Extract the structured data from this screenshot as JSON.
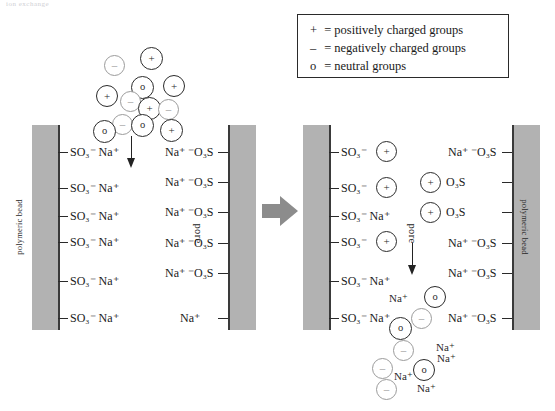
{
  "figure": {
    "cropped_header_text": "ion exchange",
    "background_color": "#ffffff"
  },
  "legend": {
    "name": "legend-box",
    "rows": [
      {
        "symbol": "+",
        "text": "= positively charged groups"
      },
      {
        "symbol": "–",
        "text": "= negatively charged groups"
      },
      {
        "symbol": "o",
        "text": "= neutral groups"
      }
    ]
  },
  "colors": {
    "bead_fill": "#b2b2b2",
    "bead_edge": "#3a3a3a",
    "dark_circle": "#2b2b2b",
    "light_circle": "#9b9b9b",
    "transition_arrow": "#8c8c8c",
    "text": "#1a1a1a"
  },
  "panels": [
    {
      "id": "before",
      "name": "panel-before",
      "bead_left_label": "polymeric bead",
      "bead_right_label": "",
      "pore_label": "pore",
      "left_wall_rows": [
        {
          "label": "SO₃⁻  Na⁺",
          "badge": null
        },
        {
          "label": "SO₃⁻  Na⁺",
          "badge": null
        },
        {
          "label": "SO₃⁻  Na⁺",
          "badge": null
        },
        {
          "label": "SO₃⁻  Na⁺",
          "badge": null
        },
        {
          "label": "SO₃⁻  Na⁺",
          "badge": null
        },
        {
          "label": "SO₃⁻  Na⁺",
          "badge": null
        }
      ],
      "right_wall_rows": [
        {
          "label": "Na⁺ ⁻O₃S",
          "badge": null
        },
        {
          "label": "Na⁺ ⁻O₃S",
          "badge": null
        },
        {
          "label": "Na⁺ ⁻O₃S",
          "badge": null
        },
        {
          "label": "Na⁺ ⁻O₃S",
          "badge": null
        },
        {
          "label": "Na⁺ ⁻O₃S",
          "badge": null
        },
        {
          "label": "Na⁺",
          "badge": null
        }
      ],
      "cluster": {
        "name": "protein-cluster-entering",
        "groups": [
          {
            "sym": "–",
            "tone": "light",
            "x": 104,
            "y": 55,
            "d": 21
          },
          {
            "sym": "+",
            "tone": "dark",
            "x": 140,
            "y": 47,
            "d": 23
          },
          {
            "sym": "o",
            "tone": "dark",
            "x": 131,
            "y": 76,
            "d": 23
          },
          {
            "sym": "+",
            "tone": "dark",
            "x": 163,
            "y": 75,
            "d": 22
          },
          {
            "sym": "+",
            "tone": "dark",
            "x": 96,
            "y": 85,
            "d": 22
          },
          {
            "sym": "–",
            "tone": "light",
            "x": 120,
            "y": 91,
            "d": 21
          },
          {
            "sym": "+",
            "tone": "dark",
            "x": 138,
            "y": 97,
            "d": 23
          },
          {
            "sym": "–",
            "tone": "light",
            "x": 158,
            "y": 99,
            "d": 21
          },
          {
            "sym": "o",
            "tone": "dark",
            "x": 131,
            "y": 114,
            "d": 23
          },
          {
            "sym": "–",
            "tone": "light",
            "x": 112,
            "y": 114,
            "d": 21
          },
          {
            "sym": "o",
            "tone": "dark",
            "x": 93,
            "y": 120,
            "d": 23
          },
          {
            "sym": "+",
            "tone": "dark",
            "x": 160,
            "y": 119,
            "d": 23
          }
        ]
      },
      "flow_arrow": {
        "name": "flow-arrow-down",
        "x": 128,
        "y": 136,
        "length": 30
      }
    },
    {
      "id": "after",
      "name": "panel-after",
      "bead_left_label": "",
      "bead_right_label": "polymeric bead",
      "pore_label": "pore",
      "left_wall_rows": [
        {
          "label": "SO₃⁻",
          "badge": "+"
        },
        {
          "label": "SO₃⁻",
          "badge": "+"
        },
        {
          "label": "SO₃⁻  Na⁺",
          "badge": null
        },
        {
          "label": "SO₃⁻",
          "badge": "+"
        },
        {
          "label": "SO₃⁻  Na⁺",
          "badge": null
        },
        {
          "label": "SO₃⁻  Na⁺",
          "badge": null
        }
      ],
      "right_wall_rows": [
        {
          "label": "Na⁺ ⁻O₃S",
          "badge": null
        },
        {
          "label": "O₃S",
          "badge": "+"
        },
        {
          "label": "O₃S",
          "badge": "+"
        },
        {
          "label": "Na⁺ ⁻O₃S",
          "badge": null
        },
        {
          "label": "Na⁺ ⁻O₃S",
          "badge": null
        },
        {
          "label": "Na⁺ ⁻O₃S",
          "badge": null
        }
      ],
      "cluster": {
        "name": "protein-cluster-bound",
        "groups": [
          {
            "sym": "o",
            "tone": "dark",
            "x": 424,
            "y": 286,
            "d": 22
          },
          {
            "sym": "–",
            "tone": "light",
            "x": 411,
            "y": 308,
            "d": 21
          },
          {
            "sym": "o",
            "tone": "dark",
            "x": 389,
            "y": 317,
            "d": 23
          },
          {
            "sym": "–",
            "tone": "light",
            "x": 393,
            "y": 340,
            "d": 21
          },
          {
            "sym": "–",
            "tone": "light",
            "x": 372,
            "y": 358,
            "d": 21
          },
          {
            "sym": "o",
            "tone": "dark",
            "x": 413,
            "y": 359,
            "d": 22
          },
          {
            "sym": "–",
            "tone": "light",
            "x": 376,
            "y": 379,
            "d": 21
          }
        ],
        "free_ions": [
          {
            "text": "Na⁺",
            "x": 389,
            "y": 293
          },
          {
            "text": "Na⁺",
            "x": 418,
            "y": 342
          },
          {
            "text": "Na⁺",
            "x": 437,
            "y": 353
          },
          {
            "text": "Na⁺",
            "x": 394,
            "y": 371
          },
          {
            "text": "Na⁺",
            "x": 423,
            "y": 383
          }
        ]
      },
      "flow_arrow": {
        "name": "flow-arrow-down",
        "x": 409,
        "y": 243,
        "length": 30
      }
    }
  ],
  "transition": {
    "name": "transition-arrow",
    "symbol": "▶"
  }
}
